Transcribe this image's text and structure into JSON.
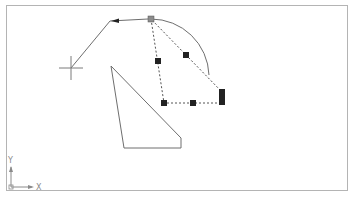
{
  "canvas": {
    "width": 358,
    "height": 197,
    "background": "#ffffff",
    "border_color": "#b4b4b4",
    "line_color": "#6e6e6e",
    "grip_color": "#222222",
    "hot_grip_color": "#8c8c8c"
  },
  "ucs_icon": {
    "x_label": "X",
    "y_label": "Y"
  },
  "entities": {
    "rubber_band_polyline": "leader with arrow from hot grip to cursor",
    "arc": "quarter arc",
    "triangle": "closed polygon",
    "selected_triangle": "dashed selected polyline with grips"
  },
  "cursor": {
    "type": "crosshair",
    "x": 71,
    "y": 68
  }
}
